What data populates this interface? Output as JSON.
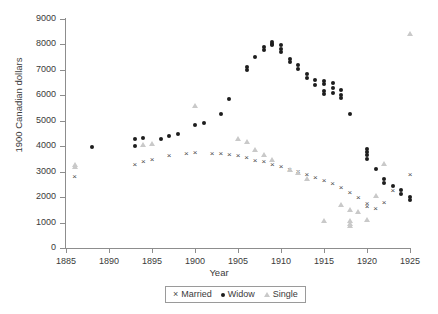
{
  "chart_data": {
    "type": "scatter",
    "title": "",
    "xlabel": "Year",
    "ylabel": "1900 Canadian dollars",
    "xlim": [
      1885,
      1925
    ],
    "ylim": [
      0,
      9000
    ],
    "xticks": [
      1885,
      1890,
      1895,
      1900,
      1905,
      1910,
      1915,
      1920,
      1925
    ],
    "yticks": [
      0,
      1000,
      2000,
      3000,
      4000,
      5000,
      6000,
      7000,
      8000,
      9000
    ],
    "grid": false,
    "legend_position": "below-axis-center",
    "colors": {
      "married": "#4a4a4a",
      "widow": "#1d1d1d",
      "single": "#c9c9c9",
      "axis": "#8d8d8d",
      "text": "#3a3a3a",
      "background": "#ffffff"
    },
    "series": [
      {
        "name": "Married",
        "marker": "x",
        "points": [
          [
            1886,
            2800
          ],
          [
            1893,
            3300
          ],
          [
            1894,
            3380
          ],
          [
            1895,
            3480
          ],
          [
            1897,
            3620
          ],
          [
            1899,
            3700
          ],
          [
            1900,
            3740
          ],
          [
            1902,
            3720
          ],
          [
            1903,
            3700
          ],
          [
            1904,
            3660
          ],
          [
            1905,
            3640
          ],
          [
            1906,
            3540
          ],
          [
            1907,
            3450
          ],
          [
            1908,
            3380
          ],
          [
            1909,
            3300
          ],
          [
            1910,
            3200
          ],
          [
            1911,
            3100
          ],
          [
            1912,
            3010
          ],
          [
            1913,
            2900
          ],
          [
            1914,
            2780
          ],
          [
            1915,
            2660
          ],
          [
            1916,
            2540
          ],
          [
            1917,
            2380
          ],
          [
            1918,
            2200
          ],
          [
            1919,
            2000
          ],
          [
            1920,
            1760
          ],
          [
            1920,
            1620
          ],
          [
            1921,
            1560
          ],
          [
            1922,
            1800
          ],
          [
            1923,
            2250
          ],
          [
            1925,
            2900
          ]
        ]
      },
      {
        "name": "Widow",
        "marker": "circle",
        "points": [
          [
            1888,
            3980
          ],
          [
            1893,
            4280
          ],
          [
            1893,
            4020
          ],
          [
            1894,
            4320
          ],
          [
            1896,
            4280
          ],
          [
            1897,
            4400
          ],
          [
            1898,
            4480
          ],
          [
            1900,
            4850
          ],
          [
            1901,
            4930
          ],
          [
            1903,
            5250
          ],
          [
            1904,
            5850
          ],
          [
            1906,
            7120
          ],
          [
            1906,
            6980
          ],
          [
            1907,
            7520
          ],
          [
            1908,
            7780
          ],
          [
            1908,
            7880
          ],
          [
            1909,
            8020
          ],
          [
            1909,
            8080
          ],
          [
            1909,
            7960
          ],
          [
            1910,
            7980
          ],
          [
            1910,
            7820
          ],
          [
            1910,
            7700
          ],
          [
            1911,
            7420
          ],
          [
            1911,
            7300
          ],
          [
            1912,
            7180
          ],
          [
            1912,
            7020
          ],
          [
            1913,
            6850
          ],
          [
            1913,
            6700
          ],
          [
            1914,
            6600
          ],
          [
            1914,
            6420
          ],
          [
            1915,
            6580
          ],
          [
            1915,
            6450
          ],
          [
            1915,
            6180
          ],
          [
            1915,
            6060
          ],
          [
            1916,
            6480
          ],
          [
            1916,
            6300
          ],
          [
            1916,
            6100
          ],
          [
            1917,
            6200
          ],
          [
            1917,
            6020
          ],
          [
            1917,
            5900
          ],
          [
            1918,
            5280
          ],
          [
            1920,
            3900
          ],
          [
            1920,
            3780
          ],
          [
            1920,
            3640
          ],
          [
            1920,
            3480
          ],
          [
            1921,
            3120
          ],
          [
            1922,
            2700
          ],
          [
            1922,
            2560
          ],
          [
            1923,
            2420
          ],
          [
            1924,
            2280
          ],
          [
            1924,
            2140
          ],
          [
            1925,
            2000
          ],
          [
            1925,
            1900
          ]
        ]
      },
      {
        "name": "Single",
        "marker": "triangle",
        "points": [
          [
            1886,
            3200
          ],
          [
            1886,
            3280
          ],
          [
            1894,
            4060
          ],
          [
            1895,
            4080
          ],
          [
            1900,
            5600
          ],
          [
            1905,
            4300
          ],
          [
            1906,
            4160
          ],
          [
            1907,
            3840
          ],
          [
            1908,
            3660
          ],
          [
            1909,
            3460
          ],
          [
            1911,
            3060
          ],
          [
            1912,
            2940
          ],
          [
            1913,
            2700
          ],
          [
            1915,
            1060
          ],
          [
            1917,
            1700
          ],
          [
            1918,
            1500
          ],
          [
            1918,
            1080
          ],
          [
            1918,
            960
          ],
          [
            1918,
            860
          ],
          [
            1919,
            1420
          ],
          [
            1920,
            1120
          ],
          [
            1921,
            2050
          ],
          [
            1922,
            3300
          ],
          [
            1925,
            8400
          ]
        ]
      }
    ]
  },
  "legend": {
    "items": [
      {
        "symbol": "x-marker",
        "label": "Married"
      },
      {
        "symbol": "dot-marker",
        "label": "Widow"
      },
      {
        "symbol": "triangle-marker",
        "label": "Single"
      }
    ]
  }
}
